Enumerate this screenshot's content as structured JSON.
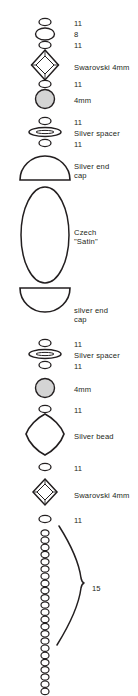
{
  "diagram": {
    "stroke_color": "#231f20",
    "bead_fill_gray": "#d4d4d4",
    "background": "#ffffff",
    "labels": [
      {
        "text": "11",
        "x": 74,
        "y": 19
      },
      {
        "text": "8",
        "x": 74,
        "y": 30
      },
      {
        "text": "11",
        "x": 74,
        "y": 41
      },
      {
        "text": "Swarovski 4mm",
        "x": 74,
        "y": 63
      },
      {
        "text": "11",
        "x": 74,
        "y": 80
      },
      {
        "text": "4mm",
        "x": 74,
        "y": 96
      },
      {
        "text": "11",
        "x": 74,
        "y": 118
      },
      {
        "text": "Silver spacer",
        "x": 74,
        "y": 129
      },
      {
        "text": "11",
        "x": 74,
        "y": 140
      },
      {
        "text": "Silver end\ncap",
        "x": 74,
        "y": 162
      },
      {
        "text": "Czech\n\"Satin\"",
        "x": 74,
        "y": 228
      },
      {
        "text": "silver end\ncap",
        "x": 74,
        "y": 306
      },
      {
        "text": "11",
        "x": 74,
        "y": 340
      },
      {
        "text": "Silver spacer",
        "x": 74,
        "y": 351
      },
      {
        "text": "11",
        "x": 74,
        "y": 362
      },
      {
        "text": "4mm",
        "x": 74,
        "y": 385
      },
      {
        "text": "11",
        "x": 74,
        "y": 406
      },
      {
        "text": "Silver bead",
        "x": 74,
        "y": 432
      },
      {
        "text": "11",
        "x": 74,
        "y": 464
      },
      {
        "text": "Swarovski 4mm",
        "x": 74,
        "y": 491
      },
      {
        "text": "11",
        "x": 74,
        "y": 516
      },
      {
        "text": "15",
        "x": 92,
        "y": 584
      }
    ],
    "components": [
      {
        "name": "seed-bead-11-top",
        "type": "small-oval",
        "label": "11",
        "cy": 22,
        "rx": 6.0,
        "ry": 3.6
      },
      {
        "name": "seed-bead-8",
        "type": "oval",
        "label": "8",
        "cy": 34,
        "rx": 9.5,
        "ry": 6.0
      },
      {
        "name": "seed-bead-11-second",
        "type": "small-oval",
        "label": "11",
        "cy": 45,
        "rx": 6.0,
        "ry": 3.6
      },
      {
        "name": "swarovski-bicone-top",
        "type": "bicone",
        "label": "Swarovski 4mm",
        "cy": 65,
        "rx": 13.5,
        "ry": 15.0
      },
      {
        "name": "seed-bead-11-third",
        "type": "small-oval",
        "label": "11",
        "cy": 84,
        "rx": 6.0,
        "ry": 3.6
      },
      {
        "name": "round-bead-4mm-top",
        "type": "round-gray",
        "label": "4mm",
        "cy": 99,
        "rx": 9.5,
        "ry": 9.5
      },
      {
        "name": "seed-bead-11-fourth",
        "type": "small-oval",
        "label": "11",
        "cy": 121,
        "rx": 6.0,
        "ry": 3.6
      },
      {
        "name": "silver-spacer-top",
        "type": "flat-disc",
        "label": "Silver spacer",
        "cy": 132,
        "rx": 16.0,
        "ry": 4.2
      },
      {
        "name": "seed-bead-11-fifth",
        "type": "small-oval",
        "label": "11",
        "cy": 143,
        "rx": 6.0,
        "ry": 3.6
      },
      {
        "name": "silver-end-cap-top",
        "type": "dome-up",
        "label": "Silver end cap",
        "cy": 170,
        "rx": 25.0,
        "ry": 22.0
      },
      {
        "name": "czech-satin-bead",
        "type": "long-oval",
        "label": "Czech \"Satin\"",
        "cy": 235,
        "rx": 24.0,
        "ry": 48.0
      },
      {
        "name": "silver-end-cap-bottom",
        "type": "dome-down",
        "label": "silver end cap",
        "cy": 297,
        "rx": 25.0,
        "ry": 22.0
      },
      {
        "name": "seed-bead-11-sixth",
        "type": "small-oval",
        "label": "11",
        "cy": 343,
        "rx": 6.0,
        "ry": 3.6
      },
      {
        "name": "silver-spacer-bottom",
        "type": "flat-disc",
        "label": "Silver spacer",
        "cy": 354,
        "rx": 16.0,
        "ry": 4.2
      },
      {
        "name": "seed-bead-11-seventh",
        "type": "small-oval",
        "label": "11",
        "cy": 365,
        "rx": 6.0,
        "ry": 3.6
      },
      {
        "name": "round-bead-4mm-bottom",
        "type": "round-gray",
        "label": "4mm",
        "cy": 388,
        "rx": 9.5,
        "ry": 9.5
      },
      {
        "name": "seed-bead-11-eighth",
        "type": "small-oval",
        "label": "11",
        "cy": 409,
        "rx": 6.0,
        "ry": 3.6
      },
      {
        "name": "silver-bead-diamond",
        "type": "rounded-diamond",
        "label": "Silver bead",
        "cy": 434,
        "rx": 20.0,
        "ry": 21.0
      },
      {
        "name": "seed-bead-11-ninth",
        "type": "small-oval",
        "label": "11",
        "cy": 467,
        "rx": 6.0,
        "ry": 3.6
      },
      {
        "name": "swarovski-bicone-bottom",
        "type": "bicone",
        "label": "Swarovski 4mm",
        "cy": 492,
        "rx": 12.0,
        "ry": 13.5
      },
      {
        "name": "seed-bead-11-tenth",
        "type": "small-oval",
        "label": "11",
        "cy": 519,
        "rx": 6.0,
        "ry": 3.6
      }
    ],
    "seed_bead_column": {
      "name": "seed-bead-15-column",
      "label": "15",
      "count": 23,
      "cx": 45,
      "start_y": 533,
      "spacing": 7.2,
      "rx": 4.0,
      "ry": 3.2
    },
    "brace": {
      "name": "brace-15",
      "label": "15",
      "tip_x": 84,
      "tip_y": 583,
      "top_y": 525,
      "bottom_y": 645
    }
  }
}
